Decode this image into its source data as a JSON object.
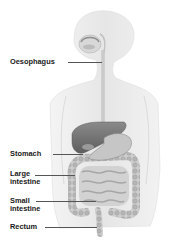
{
  "diagram": {
    "labels": [
      {
        "id": "oesophagus",
        "text": "Oesophagus"
      },
      {
        "id": "stomach",
        "text": "Stomach"
      },
      {
        "id": "large-intestine",
        "line1": "Large",
        "line2": "intestine"
      },
      {
        "id": "small-intestine",
        "line1": "Small",
        "line2": "intestine"
      },
      {
        "id": "rectum",
        "text": "Rectum"
      }
    ],
    "colors": {
      "body_fill": "#ececec",
      "body_stroke": "#d4d4d4",
      "organ_dark": "#7a7a7a",
      "organ_mid": "#a8a8a8",
      "organ_light": "#cfcfcf",
      "label_text": "#1a1a1a",
      "leader_line": "#555555"
    }
  }
}
